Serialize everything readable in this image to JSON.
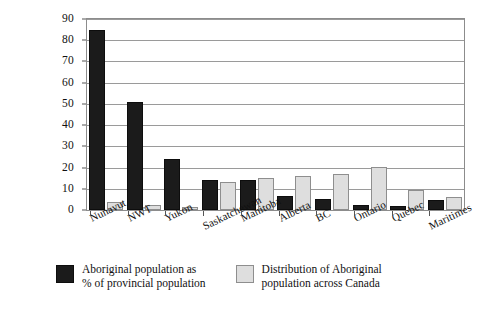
{
  "chart_data": {
    "type": "bar",
    "title": "",
    "subtitle": "",
    "xlabel": "",
    "ylabel": "",
    "ylim": [
      0,
      90
    ],
    "yticks": [
      0,
      10,
      20,
      30,
      40,
      50,
      60,
      70,
      80,
      90
    ],
    "grid": true,
    "legend_position": "bottom",
    "categories": [
      "Nunavut",
      "NWT",
      "Yukon",
      "Saskatchewan",
      "Manitoba",
      "Alberta",
      "BC",
      "Ontario",
      "Quebec",
      "Maritimes"
    ],
    "series": [
      {
        "name": "Aboriginal population as\n% of provincial population",
        "color": "#1b1b1b",
        "values": [
          85,
          51,
          24,
          14,
          14,
          6.5,
          5,
          2.5,
          2,
          4.5
        ]
      },
      {
        "name": "Distribution of Aboriginal\npopulation across Canada",
        "color": "#dedede",
        "values": [
          4,
          2.5,
          1.5,
          13,
          15,
          16,
          17,
          20.5,
          9.5,
          6
        ]
      }
    ]
  },
  "axis": {
    "y_tick_labels": [
      "0",
      "10",
      "20",
      "30",
      "40",
      "50",
      "60",
      "70",
      "80",
      "90"
    ]
  },
  "legend": {
    "entries": [
      {
        "label": "Aboriginal population as\n% of provincial population",
        "swatch": "dark"
      },
      {
        "label": "Distribution of Aboriginal\npopulation across Canada",
        "swatch": "light"
      }
    ]
  },
  "colors": {
    "series_dark": "#1b1b1b",
    "series_light": "#dedede",
    "gridline": "#9a9a9a",
    "frame": "#8c8c8c",
    "text": "#111111",
    "background": "#ffffff"
  }
}
